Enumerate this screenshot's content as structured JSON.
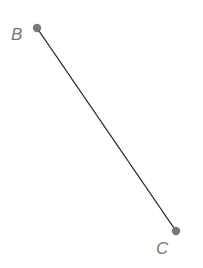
{
  "diagram": {
    "points": [
      {
        "label": "B",
        "x": 37,
        "y": 28,
        "label_x": 12,
        "label_y": 39
      },
      {
        "label": "C",
        "x": 176,
        "y": 231,
        "label_x": 157,
        "label_y": 253
      }
    ],
    "segment": {
      "from": "B",
      "to": "C"
    },
    "colors": {
      "line": "#222222",
      "point": "#777777",
      "label": "#777777"
    }
  }
}
